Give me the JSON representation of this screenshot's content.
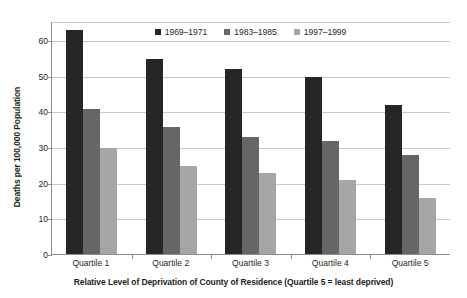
{
  "chart_data": {
    "type": "bar",
    "title": "",
    "subtitle": "",
    "xlabel": "Relative Level of Deprivation of County of Residence (Quartile 5 = least deprived)",
    "ylabel": "Deaths per 100,000 Population",
    "categories": [
      "Quartile 1",
      "Quartile 2",
      "Quartile 3",
      "Quartile 4",
      "Quartile 5"
    ],
    "series": [
      {
        "name": "1969–1971",
        "color": "#262626",
        "values": [
          63,
          55,
          52,
          50,
          42
        ]
      },
      {
        "name": "1983–1985",
        "color": "#666666",
        "values": [
          41,
          36,
          33,
          32,
          28
        ]
      },
      {
        "name": "1997–1999",
        "color": "#a6a6a6",
        "values": [
          30,
          25,
          23,
          21,
          16
        ]
      }
    ],
    "ylim": [
      0,
      65
    ],
    "yticks": [
      0,
      10,
      20,
      30,
      40,
      50,
      60
    ],
    "ytick_labels": [
      "0",
      "10",
      "20",
      "30",
      "40",
      "50",
      "60"
    ],
    "grid": "horizontal",
    "legend_position": "top-center",
    "gridline_color": "#c9c9c9",
    "axis_color": "#8c8c8c",
    "text_color": "#231f20",
    "background_color": "#ffffff"
  }
}
